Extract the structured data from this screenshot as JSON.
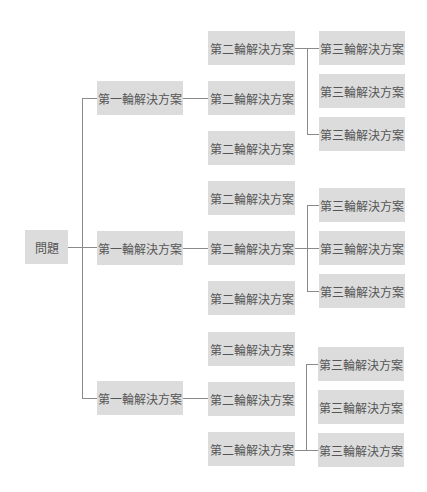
{
  "diagram": {
    "type": "tree",
    "colors": {
      "node_fill": "#dcdcdc",
      "node_text": "#555555",
      "connector": "#8a8a8a",
      "background": "#ffffff"
    },
    "root": {
      "label": "問題"
    },
    "level1": [
      {
        "label": "第一輪解決方案",
        "level2": [
          {
            "label": "第二輪解決方案",
            "has_children": true
          },
          {
            "label": "第二輪解決方案"
          },
          {
            "label": "第二輪解決方案"
          }
        ],
        "level3": [
          {
            "label": "第三輪解決方案"
          },
          {
            "label": "第三輪解決方案"
          },
          {
            "label": "第三輪解決方案"
          }
        ]
      },
      {
        "label": "第一輪解決方案",
        "level2": [
          {
            "label": "第二輪解決方案"
          },
          {
            "label": "第二輪解決方案",
            "has_children": true
          },
          {
            "label": "第二輪解決方案"
          }
        ],
        "level3": [
          {
            "label": "第三輪解決方案"
          },
          {
            "label": "第三輪解決方案"
          },
          {
            "label": "第三輪解決方案"
          }
        ]
      },
      {
        "label": "第一輪解決方案",
        "level2": [
          {
            "label": "第二輪解決方案"
          },
          {
            "label": "第二輪解決方案"
          },
          {
            "label": "第二輪解決方案",
            "has_children": true
          }
        ],
        "level3": [
          {
            "label": "第三輪解決方案"
          },
          {
            "label": "第三輪解決方案"
          },
          {
            "label": "第三輪解決方案"
          }
        ]
      }
    ]
  }
}
